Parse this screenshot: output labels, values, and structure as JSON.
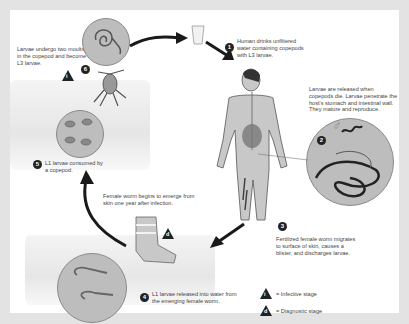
{
  "diagram": {
    "steps": [
      {
        "num": "1",
        "text": "Human drinks unfiltered water containing copepods with L3 larvae."
      },
      {
        "num": "2",
        "text": "Larvae are released when copepods die. Larvae penetrate the host's stomach and intestinal wall. They mature and reproduce."
      },
      {
        "num": "3",
        "text": "Fertilized female worm migrates to surface of skin, causes a blister, and discharges larvae."
      },
      {
        "num": "4",
        "text": "L1 larvae released into water from the emerging female worm."
      },
      {
        "num": "5",
        "text": "L1 larvae consumed by a copepod."
      },
      {
        "num": "6",
        "text": "Larvae undergo two moults in the copepod and become L3 larvae."
      }
    ],
    "annotations": {
      "emerge": "Female worm begins to emerge from skin one year after infection."
    },
    "stage_markers": {
      "infective": {
        "glyph": "i",
        "label": "= Infective stage"
      },
      "diagnostic": {
        "glyph": "d",
        "label": "= Diagnostic stage"
      }
    },
    "male_symbol": "♂",
    "colors": {
      "background": "#e3e3e3",
      "panel": "#ffffff",
      "circle_fill": "#bdbdbd",
      "arrow": "#1a1a1a",
      "skin": "#c8c8c8"
    }
  }
}
